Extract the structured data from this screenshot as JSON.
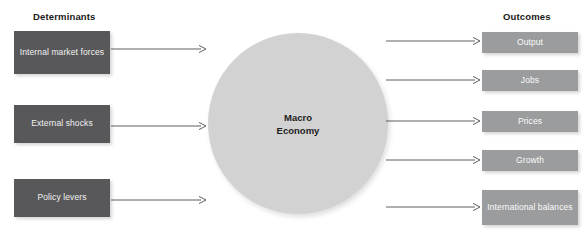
{
  "diagram": {
    "width": 588,
    "height": 248,
    "background": "#ffffff"
  },
  "colors": {
    "determinant_box": "#58585a",
    "outcome_box": "#9a9c9d",
    "center_circle": "#d2d2d2",
    "heading_text": "#1a1a1a",
    "box_text": "#f2f2f2",
    "center_text": "#1d1d1d",
    "arrow": "#4d4d4d"
  },
  "headings": {
    "left": "Determinants",
    "right": "Outcomes"
  },
  "determinants": [
    {
      "id": "internal-market-forces",
      "label": "Internal market\nforces"
    },
    {
      "id": "external-shocks",
      "label": "External shocks"
    },
    {
      "id": "policy-levers",
      "label": "Policy levers"
    }
  ],
  "center": {
    "id": "macro-economy",
    "label": "Macro\nEconomy"
  },
  "outcomes": [
    {
      "id": "output",
      "label": "Output"
    },
    {
      "id": "jobs",
      "label": "Jobs"
    },
    {
      "id": "prices",
      "label": "Prices"
    },
    {
      "id": "growth",
      "label": "Growth"
    },
    {
      "id": "international-balances",
      "label": "International\nbalances"
    }
  ],
  "arrows": {
    "inbound": [
      {
        "id": "arrow-internal-market-forces-to-macro-economy",
        "from": "internal-market-forces",
        "to": "macro-economy",
        "x1": 111,
        "y1": 49,
        "x2": 206,
        "y2": 49
      },
      {
        "id": "arrow-external-shocks-to-macro-economy",
        "from": "external-shocks",
        "to": "macro-economy",
        "x1": 111,
        "y1": 126,
        "x2": 206,
        "y2": 126
      },
      {
        "id": "arrow-policy-levers-to-macro-economy",
        "from": "policy-levers",
        "to": "macro-economy",
        "x1": 111,
        "y1": 200,
        "x2": 206,
        "y2": 200
      }
    ],
    "outbound": [
      {
        "id": "arrow-macro-economy-to-output",
        "from": "macro-economy",
        "to": "output",
        "x1": 386,
        "y1": 41,
        "x2": 480,
        "y2": 41
      },
      {
        "id": "arrow-macro-economy-to-jobs",
        "from": "macro-economy",
        "to": "jobs",
        "x1": 386,
        "y1": 80,
        "x2": 480,
        "y2": 80
      },
      {
        "id": "arrow-macro-economy-to-prices",
        "from": "macro-economy",
        "to": "prices",
        "x1": 386,
        "y1": 121,
        "x2": 480,
        "y2": 121
      },
      {
        "id": "arrow-macro-economy-to-growth",
        "from": "macro-economy",
        "to": "growth",
        "x1": 386,
        "y1": 160,
        "x2": 480,
        "y2": 160
      },
      {
        "id": "arrow-macro-economy-to-international-balances",
        "from": "macro-economy",
        "to": "international-balances",
        "x1": 386,
        "y1": 207,
        "x2": 480,
        "y2": 207
      }
    ]
  }
}
